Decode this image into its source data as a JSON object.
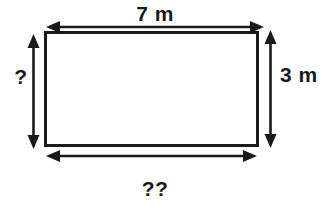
{
  "figure": {
    "type": "geometry-diagram",
    "shape": "rectangle",
    "title": "",
    "background_color": "#ffffff",
    "stroke_color": "#1a1a1a",
    "text_color": "#1a1a1a",
    "dimensions": {
      "top": {
        "label": "7 m",
        "value": 7,
        "unit": "m",
        "known": true,
        "side": "top",
        "arrow": "double-headed-horizontal"
      },
      "left": {
        "label": "?",
        "value": null,
        "unit": "m",
        "known": false,
        "side": "left",
        "arrow": "double-headed-vertical"
      },
      "right": {
        "label": "3 m",
        "value": 3,
        "unit": "m",
        "known": true,
        "side": "right",
        "arrow": "double-headed-vertical"
      },
      "bottom": {
        "label": "??",
        "value": null,
        "unit": "m",
        "known": false,
        "side": "bottom",
        "arrow": "double-headed-horizontal"
      }
    },
    "icons": {
      "rectangle": "rectangle-outline-icon",
      "top_arrow": "double-arrow-horizontal-icon",
      "left_arrow": "double-arrow-vertical-icon",
      "right_arrow": "double-arrow-vertical-icon",
      "bottom_arrow": "double-arrow-horizontal-icon"
    }
  }
}
